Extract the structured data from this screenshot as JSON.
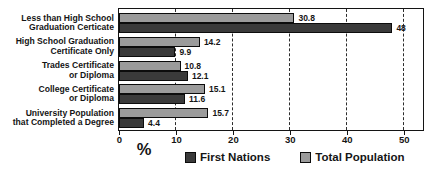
{
  "chart_data": {
    "type": "bar",
    "orientation": "horizontal",
    "title": "",
    "xlabel": "%",
    "xlim": [
      0,
      53.2
    ],
    "xticks": [
      0,
      10,
      20,
      30,
      40,
      50
    ],
    "grid": "dashed-vertical",
    "legend_position": "bottom",
    "categories": [
      "Less than High School\nGraduation Certicate",
      "High School Graduation\nCertificate Only",
      "Trades Certificate\nor Diploma",
      "College Certificate\nor Diploma",
      "University Population\nthat Completed a Degree"
    ],
    "series": [
      {
        "name": "Total Population",
        "color": "#9b9b9b",
        "values": [
          30.8,
          14.2,
          10.8,
          15.1,
          15.7
        ],
        "labels": [
          "30.8",
          "14.2",
          "10.8",
          "15.1",
          "15.7"
        ]
      },
      {
        "name": "First Nations",
        "color": "#3a3a3a",
        "values": [
          48,
          9.9,
          12.1,
          11.6,
          4.4
        ],
        "labels": [
          "48",
          "9.9",
          "12.1",
          "11.6",
          "4.4"
        ]
      }
    ]
  },
  "legend": {
    "items": [
      {
        "label": "First Nations",
        "color": "#3a3a3a"
      },
      {
        "label": "Total Population",
        "color": "#9b9b9b"
      }
    ]
  },
  "colors": {
    "frame_border": "#141414",
    "text": "#151515",
    "background": "#ffffff"
  }
}
